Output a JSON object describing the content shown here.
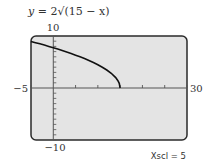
{
  "chart_data": {
    "type": "line",
    "title": "y = 2√(15 − x)",
    "title_parts": {
      "lhs": "y",
      "eq": " = 2",
      "radical": "√",
      "radicand": "(15 − x)"
    },
    "function": "2*sqrt(15 - x)",
    "domain": [
      -5,
      15
    ],
    "series": [
      {
        "name": "y = 2√(15 − x)",
        "x": [
          -5,
          -4,
          -3,
          -2,
          -1,
          0,
          1,
          2,
          3,
          4,
          5,
          6,
          7,
          8,
          9,
          10,
          11,
          12,
          13,
          14,
          14.5,
          14.8,
          15
        ],
        "y": [
          8.94,
          8.72,
          8.49,
          8.25,
          8.0,
          7.75,
          7.48,
          7.21,
          6.93,
          6.63,
          6.32,
          6.0,
          5.66,
          5.29,
          4.9,
          4.47,
          4.0,
          3.46,
          2.83,
          2.0,
          1.41,
          0.89,
          0.0
        ]
      }
    ],
    "xlim": [
      -5,
      30
    ],
    "ylim": [
      -10,
      10
    ],
    "xscl": 5,
    "yscl": 1,
    "tick_labels": {
      "xmin": "−5",
      "xmax": "30",
      "ymax": "10",
      "ymin": "−10"
    },
    "annotation": "Xscl = 5",
    "grid": false,
    "legend": "none",
    "xlabel": "",
    "ylabel": ""
  },
  "colors": {
    "screen": "#e4e4e4",
    "border": "#2a2a2a",
    "curve": "#111111",
    "axis": "#555555"
  }
}
